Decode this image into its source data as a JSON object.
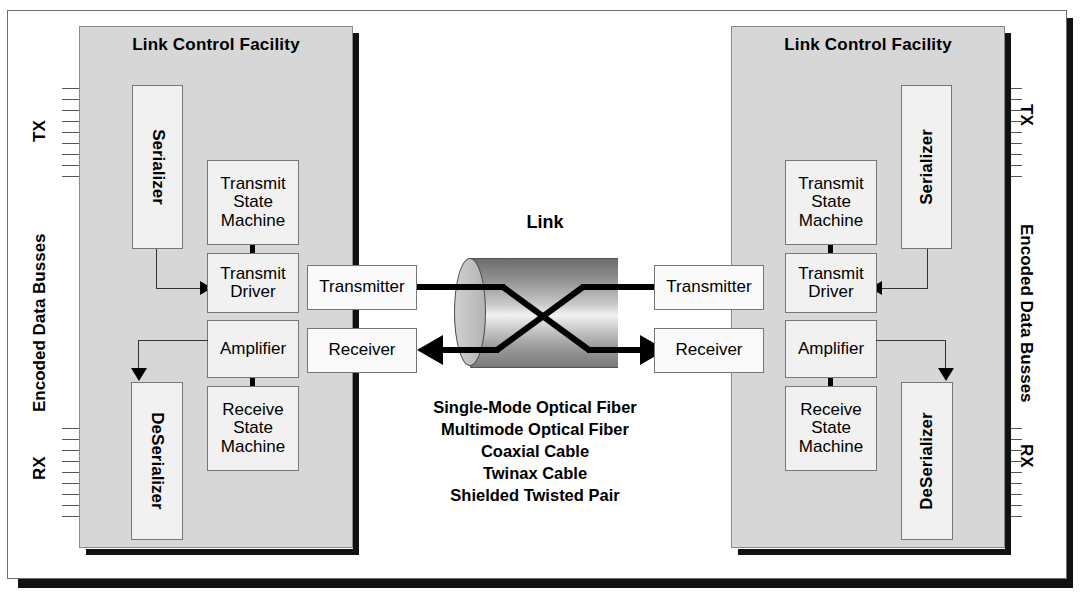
{
  "diagram": {
    "link": {
      "label": "Link",
      "media": [
        "Single-Mode Optical Fiber",
        "Multimode Optical Fiber",
        "Coaxial Cable",
        "Twinax Cable",
        "Shielded Twisted Pair"
      ]
    },
    "side_labels": {
      "tx": "TX",
      "rx": "RX",
      "bus": "Encoded Data Busses"
    },
    "facility": {
      "title": "Link Control Facility",
      "blocks": {
        "serializer": "Serializer",
        "deserializer": "DeSerializer",
        "transmit_state_machine": "Transmit\nState\nMachine",
        "transmit_state_machine_l1": "Transmit",
        "transmit_state_machine_l2": "State",
        "transmit_state_machine_l3": "Machine",
        "transmit_driver_l1": "Transmit",
        "transmit_driver_l2": "Driver",
        "amplifier": "Amplifier",
        "receive_state_machine_l1": "Receive",
        "receive_state_machine_l2": "State",
        "receive_state_machine_l3": "Machine",
        "transmitter": "Transmitter",
        "receiver": "Receiver"
      }
    },
    "colors": {
      "facility_fill": "#d7d7d7",
      "box_fill": "#f1f1f1",
      "line": "#000000",
      "shadow": "#111111",
      "bus_line": "#555555"
    },
    "bus_line_count": 9
  }
}
